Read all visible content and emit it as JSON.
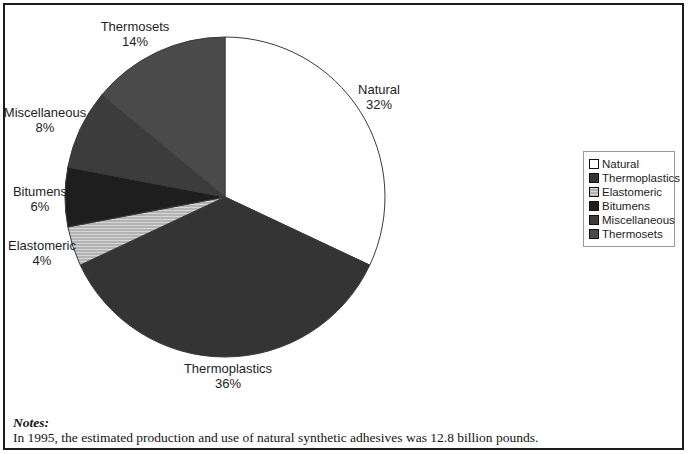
{
  "chart_data": {
    "type": "pie",
    "title": "",
    "categories": [
      "Natural",
      "Thermoplastics",
      "Elastomeric",
      "Bitumens",
      "Miscellaneous",
      "Thermosets"
    ],
    "values": [
      32,
      36,
      4,
      6,
      8,
      14
    ],
    "unit": "%",
    "start_angle_deg": 0,
    "direction": "clockwise",
    "legend_position": "right",
    "colors": {
      "Natural": "#ffffff",
      "Thermoplastics": "#343434",
      "Elastomeric": "stripes",
      "Bitumens": "#1e1e1e",
      "Miscellaneous": "#3c3c3c",
      "Thermosets": "#4a4a4a"
    },
    "stripe_pattern": {
      "base": "#b3b3b3",
      "line": "#d6d6d6"
    },
    "outline_color": "#3a3a3a",
    "pie_geometry": {
      "cx": 225,
      "cy": 197,
      "r": 160
    },
    "labels": [
      {
        "name": "Natural",
        "value_label": "32%",
        "x": 379,
        "y": 82
      },
      {
        "name": "Thermoplastics",
        "value_label": "36%",
        "x": 228,
        "y": 361
      },
      {
        "name": "Elastomeric",
        "value_label": "4%",
        "x": 42,
        "y": 238
      },
      {
        "name": "Bitumens",
        "value_label": "6%",
        "x": 40,
        "y": 184
      },
      {
        "name": "Miscellaneous",
        "value_label": "8%",
        "x": 45,
        "y": 105
      },
      {
        "name": "Thermosets",
        "value_label": "14%",
        "x": 135,
        "y": 19
      }
    ]
  },
  "legend": {
    "items": [
      "Natural",
      "Thermoplastics",
      "Elastomeric",
      "Bitumens",
      "Miscellaneous",
      "Thermosets"
    ]
  },
  "notes": {
    "title": "Notes:",
    "text": "In 1995, the estimated production and use of natural synthetic adhesives was 12.8 billion pounds."
  }
}
